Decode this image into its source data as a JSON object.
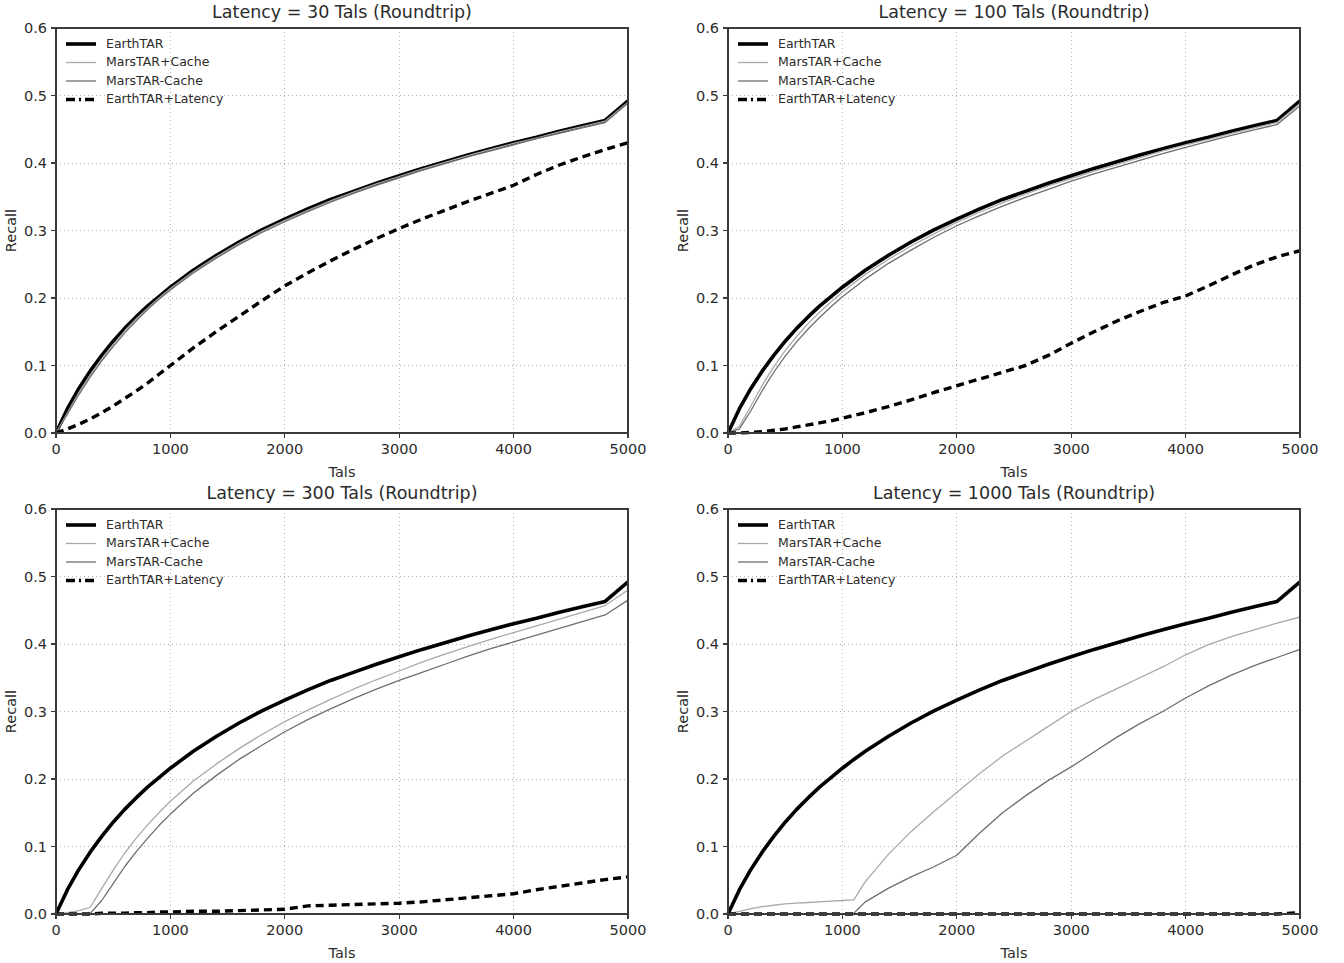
{
  "figure": {
    "background_color": "#ffffff",
    "panel_count": 4
  },
  "axes": {
    "xlabel": "Tals",
    "ylabel": "Recall",
    "xticks": [
      "0",
      "1000",
      "2000",
      "3000",
      "4000",
      "5000"
    ],
    "yticks": [
      "0.0",
      "0.1",
      "0.2",
      "0.3",
      "0.4",
      "0.5",
      "0.6"
    ],
    "xlim": [
      0,
      5000
    ],
    "ylim": [
      0.0,
      0.6
    ],
    "grid": true,
    "grid_color": "#b4b4b4",
    "spine_color": "#3a3a3a"
  },
  "legend": {
    "position": "upper left",
    "entries": [
      {
        "label": "EarthTAR",
        "color": "#000000",
        "width": 3.6,
        "dash": "none"
      },
      {
        "label": "MarsTAR+Cache",
        "color": "#a9a9a9",
        "width": 1.3,
        "dash": "none"
      },
      {
        "label": "MarsTAR-Cache",
        "color": "#6e6e6e",
        "width": 1.3,
        "dash": "none"
      },
      {
        "label": "EarthTAR+Latency",
        "color": "#000000",
        "width": 3.4,
        "dash": "8 5"
      }
    ]
  },
  "chart_data": [
    {
      "type": "line",
      "title": "Latency = 30 Tals (Roundtrip)",
      "xlabel": "Tals",
      "ylabel": "Recall",
      "xlim": [
        0,
        5000
      ],
      "ylim": [
        0.0,
        0.6
      ],
      "x": [
        0,
        100,
        200,
        300,
        400,
        500,
        600,
        700,
        800,
        900,
        1000,
        1200,
        1400,
        1600,
        1800,
        2000,
        2200,
        2400,
        2600,
        2800,
        3000,
        3200,
        3400,
        3600,
        3800,
        4000,
        4200,
        4400,
        4600,
        4800,
        5000
      ],
      "series": [
        {
          "name": "EarthTAR",
          "color": "#000000",
          "width": 3.6,
          "dash": "none",
          "values": [
            0.0,
            0.036,
            0.066,
            0.092,
            0.115,
            0.136,
            0.155,
            0.172,
            0.188,
            0.202,
            0.216,
            0.241,
            0.263,
            0.283,
            0.301,
            0.317,
            0.332,
            0.346,
            0.358,
            0.37,
            0.381,
            0.392,
            0.402,
            0.412,
            0.421,
            0.43,
            0.438,
            0.447,
            0.455,
            0.463,
            0.492
          ]
        },
        {
          "name": "MarsTAR+Cache",
          "color": "#a9a9a9",
          "width": 1.3,
          "dash": "none",
          "values": [
            0.0,
            0.03,
            0.06,
            0.086,
            0.11,
            0.131,
            0.151,
            0.169,
            0.185,
            0.2,
            0.214,
            0.239,
            0.261,
            0.281,
            0.299,
            0.315,
            0.33,
            0.344,
            0.357,
            0.369,
            0.38,
            0.391,
            0.401,
            0.411,
            0.42,
            0.429,
            0.437,
            0.446,
            0.454,
            0.462,
            0.49
          ]
        },
        {
          "name": "MarsTAR-Cache",
          "color": "#6e6e6e",
          "width": 1.3,
          "dash": "none",
          "values": [
            0.0,
            0.028,
            0.057,
            0.083,
            0.107,
            0.128,
            0.148,
            0.166,
            0.183,
            0.198,
            0.212,
            0.237,
            0.259,
            0.279,
            0.297,
            0.313,
            0.328,
            0.342,
            0.355,
            0.367,
            0.378,
            0.389,
            0.399,
            0.409,
            0.418,
            0.427,
            0.436,
            0.444,
            0.452,
            0.46,
            0.489
          ]
        },
        {
          "name": "EarthTAR+Latency",
          "color": "#000000",
          "width": 3.4,
          "dash": "8 5",
          "values": [
            0.0,
            0.006,
            0.013,
            0.021,
            0.03,
            0.04,
            0.051,
            0.062,
            0.074,
            0.087,
            0.1,
            0.126,
            0.15,
            0.173,
            0.196,
            0.218,
            0.237,
            0.255,
            0.272,
            0.288,
            0.303,
            0.317,
            0.33,
            0.343,
            0.355,
            0.367,
            0.383,
            0.397,
            0.409,
            0.42,
            0.43
          ]
        }
      ]
    },
    {
      "type": "line",
      "title": "Latency = 100 Tals (Roundtrip)",
      "xlabel": "Tals",
      "ylabel": "Recall",
      "xlim": [
        0,
        5000
      ],
      "ylim": [
        0.0,
        0.6
      ],
      "x": [
        0,
        100,
        200,
        300,
        400,
        500,
        600,
        700,
        800,
        900,
        1000,
        1200,
        1400,
        1600,
        1800,
        2000,
        2200,
        2400,
        2600,
        2800,
        3000,
        3200,
        3400,
        3600,
        3800,
        4000,
        4200,
        4400,
        4600,
        4800,
        5000
      ],
      "series": [
        {
          "name": "EarthTAR",
          "color": "#000000",
          "width": 3.6,
          "dash": "none",
          "values": [
            0.0,
            0.036,
            0.066,
            0.092,
            0.115,
            0.136,
            0.155,
            0.172,
            0.188,
            0.202,
            0.216,
            0.241,
            0.263,
            0.283,
            0.301,
            0.317,
            0.332,
            0.346,
            0.358,
            0.37,
            0.381,
            0.392,
            0.402,
            0.412,
            0.421,
            0.43,
            0.438,
            0.447,
            0.455,
            0.463,
            0.492
          ]
        },
        {
          "name": "MarsTAR+Cache",
          "color": "#a9a9a9",
          "width": 1.3,
          "dash": "none",
          "values": [
            0.0,
            0.01,
            0.04,
            0.071,
            0.098,
            0.122,
            0.143,
            0.162,
            0.179,
            0.194,
            0.209,
            0.235,
            0.257,
            0.277,
            0.295,
            0.312,
            0.327,
            0.341,
            0.354,
            0.366,
            0.377,
            0.388,
            0.398,
            0.408,
            0.418,
            0.427,
            0.435,
            0.444,
            0.452,
            0.46,
            0.488
          ]
        },
        {
          "name": "MarsTAR-Cache",
          "color": "#6e6e6e",
          "width": 1.3,
          "dash": "none",
          "values": [
            0.0,
            0.006,
            0.033,
            0.063,
            0.09,
            0.114,
            0.135,
            0.154,
            0.171,
            0.187,
            0.202,
            0.228,
            0.251,
            0.271,
            0.29,
            0.307,
            0.322,
            0.336,
            0.349,
            0.361,
            0.373,
            0.384,
            0.394,
            0.404,
            0.414,
            0.423,
            0.432,
            0.441,
            0.449,
            0.457,
            0.485
          ]
        },
        {
          "name": "EarthTAR+Latency",
          "color": "#000000",
          "width": 3.4,
          "dash": "8 5",
          "values": [
            0.0,
            0.0,
            0.001,
            0.002,
            0.004,
            0.006,
            0.009,
            0.012,
            0.015,
            0.018,
            0.022,
            0.03,
            0.039,
            0.049,
            0.06,
            0.07,
            0.08,
            0.09,
            0.1,
            0.115,
            0.133,
            0.15,
            0.166,
            0.18,
            0.193,
            0.203,
            0.218,
            0.234,
            0.249,
            0.261,
            0.27
          ]
        }
      ]
    },
    {
      "type": "line",
      "title": "Latency = 300 Tals (Roundtrip)",
      "xlabel": "Tals",
      "ylabel": "Recall",
      "xlim": [
        0,
        5000
      ],
      "ylim": [
        0.0,
        0.6
      ],
      "x": [
        0,
        100,
        200,
        300,
        400,
        500,
        600,
        700,
        800,
        900,
        1000,
        1200,
        1400,
        1600,
        1800,
        2000,
        2200,
        2400,
        2600,
        2800,
        3000,
        3200,
        3400,
        3600,
        3800,
        4000,
        4200,
        4400,
        4600,
        4800,
        5000
      ],
      "series": [
        {
          "name": "EarthTAR",
          "color": "#000000",
          "width": 3.6,
          "dash": "none",
          "values": [
            0.0,
            0.036,
            0.066,
            0.092,
            0.115,
            0.136,
            0.155,
            0.172,
            0.188,
            0.202,
            0.216,
            0.241,
            0.263,
            0.283,
            0.301,
            0.317,
            0.332,
            0.346,
            0.358,
            0.37,
            0.381,
            0.392,
            0.402,
            0.412,
            0.421,
            0.43,
            0.438,
            0.447,
            0.455,
            0.463,
            0.492
          ]
        },
        {
          "name": "MarsTAR+Cache",
          "color": "#a9a9a9",
          "width": 1.3,
          "dash": "none",
          "values": [
            0.0,
            0.002,
            0.005,
            0.01,
            0.038,
            0.065,
            0.09,
            0.112,
            0.132,
            0.15,
            0.167,
            0.197,
            0.222,
            0.245,
            0.266,
            0.285,
            0.302,
            0.318,
            0.333,
            0.347,
            0.36,
            0.373,
            0.385,
            0.396,
            0.407,
            0.417,
            0.427,
            0.437,
            0.447,
            0.457,
            0.48
          ]
        },
        {
          "name": "MarsTAR-Cache",
          "color": "#6e6e6e",
          "width": 1.3,
          "dash": "none",
          "values": [
            0.0,
            0.0,
            0.0,
            0.001,
            0.02,
            0.045,
            0.07,
            0.092,
            0.112,
            0.131,
            0.148,
            0.179,
            0.205,
            0.229,
            0.25,
            0.27,
            0.288,
            0.304,
            0.319,
            0.333,
            0.346,
            0.358,
            0.37,
            0.382,
            0.393,
            0.403,
            0.413,
            0.423,
            0.433,
            0.443,
            0.465
          ]
        },
        {
          "name": "EarthTAR+Latency",
          "color": "#000000",
          "width": 3.4,
          "dash": "8 5",
          "values": [
            0.0,
            0.0,
            0.0,
            0.0,
            0.001,
            0.001,
            0.001,
            0.002,
            0.002,
            0.003,
            0.003,
            0.004,
            0.004,
            0.005,
            0.006,
            0.007,
            0.012,
            0.013,
            0.014,
            0.015,
            0.016,
            0.018,
            0.021,
            0.024,
            0.027,
            0.03,
            0.036,
            0.041,
            0.046,
            0.051,
            0.055
          ]
        }
      ]
    },
    {
      "type": "line",
      "title": "Latency = 1000 Tals (Roundtrip)",
      "xlabel": "Tals",
      "ylabel": "Recall",
      "xlim": [
        0,
        5000
      ],
      "ylim": [
        0.0,
        0.6
      ],
      "x": [
        0,
        100,
        200,
        300,
        400,
        500,
        600,
        700,
        800,
        900,
        1000,
        1100,
        1200,
        1400,
        1600,
        1800,
        2000,
        2200,
        2400,
        2600,
        2800,
        3000,
        3200,
        3400,
        3600,
        3800,
        4000,
        4200,
        4400,
        4600,
        4800,
        5000
      ],
      "series": [
        {
          "name": "EarthTAR",
          "color": "#000000",
          "width": 3.6,
          "dash": "none",
          "values": [
            0.0,
            0.036,
            0.066,
            0.092,
            0.115,
            0.136,
            0.155,
            0.172,
            0.188,
            0.202,
            0.216,
            0.229,
            0.241,
            0.263,
            0.283,
            0.301,
            0.317,
            0.332,
            0.346,
            0.358,
            0.37,
            0.381,
            0.392,
            0.402,
            0.412,
            0.421,
            0.43,
            0.438,
            0.447,
            0.455,
            0.463,
            0.492
          ]
        },
        {
          "name": "MarsTAR+Cache",
          "color": "#a9a9a9",
          "width": 1.3,
          "dash": "none",
          "values": [
            0.0,
            0.004,
            0.008,
            0.011,
            0.013,
            0.015,
            0.016,
            0.017,
            0.018,
            0.019,
            0.02,
            0.021,
            0.048,
            0.088,
            0.122,
            0.152,
            0.18,
            0.208,
            0.234,
            0.256,
            0.278,
            0.3,
            0.318,
            0.334,
            0.35,
            0.366,
            0.384,
            0.399,
            0.411,
            0.421,
            0.431,
            0.44
          ]
        },
        {
          "name": "MarsTAR-Cache",
          "color": "#6e6e6e",
          "width": 1.3,
          "dash": "none",
          "values": [
            0.0,
            0.0,
            0.0,
            0.0,
            0.0,
            0.0,
            0.0,
            0.0,
            0.0,
            0.0,
            0.0,
            0.001,
            0.018,
            0.038,
            0.055,
            0.07,
            0.087,
            0.12,
            0.15,
            0.175,
            0.198,
            0.218,
            0.24,
            0.262,
            0.282,
            0.3,
            0.32,
            0.338,
            0.354,
            0.368,
            0.38,
            0.392
          ]
        },
        {
          "name": "EarthTAR+Latency",
          "color": "#000000",
          "width": 3.4,
          "dash": "8 5",
          "values": [
            0.0,
            0.0,
            0.0,
            0.0,
            0.0,
            0.0,
            0.0,
            0.0,
            0.0,
            0.0,
            0.0,
            0.0,
            0.0,
            0.0,
            0.0,
            0.0,
            0.0,
            0.0,
            0.0,
            0.0,
            0.0,
            0.0,
            0.0,
            0.0,
            0.0,
            0.0,
            0.0,
            0.0,
            0.0,
            0.0,
            0.0,
            0.002
          ]
        }
      ]
    }
  ]
}
